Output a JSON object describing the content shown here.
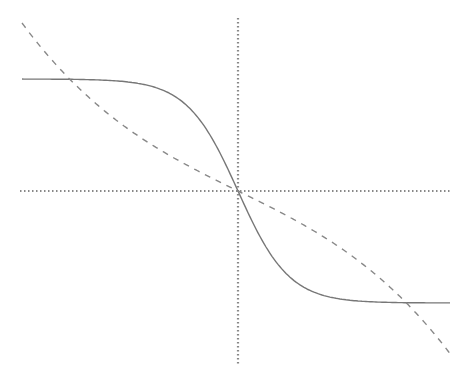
{
  "chart_data": {
    "type": "line",
    "title": "",
    "xlabel": "",
    "ylabel": "",
    "grid": false,
    "legend": null,
    "xlim": [
      -216,
      212
    ],
    "ylim": [
      -175,
      172
    ],
    "axes": {
      "origin_px": [
        238,
        191
      ],
      "x_axis_px": [
        20,
        450
      ],
      "y_axis_px": [
        18,
        366
      ],
      "style": "dotted",
      "color": "#888888"
    },
    "series": [
      {
        "name": "solid-sigmoid",
        "style": "solid",
        "color": "#777777",
        "description": "decreasing tanh-shaped curve, plateau high on left, low on right",
        "model": "y = -112 * tanh(0.0196 * x)",
        "x": [
          -216,
          -180,
          -150,
          -120,
          -100,
          -80,
          -60,
          -40,
          -28,
          -20,
          -10,
          0,
          10,
          20,
          28,
          40,
          60,
          80,
          100,
          120,
          150,
          180,
          212
        ],
        "values": [
          112,
          111,
          109.5,
          106,
          101,
          94,
          93,
          72,
          56,
          42,
          22,
          0,
          -22,
          -42,
          -56,
          -72,
          -93,
          -102,
          -107,
          -110,
          -111.5,
          -112,
          -113
        ]
      },
      {
        "name": "dashed-cubic",
        "style": "dashed",
        "color": "#888888",
        "description": "cubic-like curve from upper left to lower right, flattening near origin",
        "model": "y = -(0.4905 * x + 6.157e-6 * x^3)",
        "x": [
          -216,
          -180,
          -150,
          -120,
          -90,
          -60,
          -30,
          0,
          30,
          60,
          90,
          120,
          150,
          180,
          212
        ],
        "values": [
          168,
          124,
          94.4,
          69.5,
          48.6,
          30.8,
          14.9,
          0,
          -14.9,
          -30.8,
          -48.6,
          -69.5,
          -94.4,
          -124,
          -170
        ]
      }
    ]
  }
}
